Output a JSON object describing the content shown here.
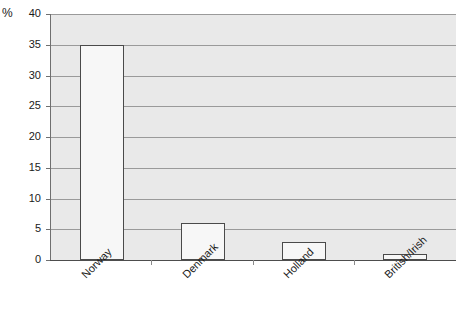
{
  "chart_data": {
    "type": "bar",
    "title": "",
    "xlabel": "",
    "ylabel": "%",
    "categories": [
      "Norway",
      "Denmark",
      "Holland",
      "British/Irish"
    ],
    "values": [
      35,
      6,
      3,
      1
    ],
    "ylim": [
      0,
      40
    ],
    "yticks": [
      0,
      5,
      10,
      15,
      20,
      25,
      30,
      35,
      40
    ],
    "ytick_labels": [
      "0",
      "5",
      "10",
      "15",
      "20",
      "25",
      "30",
      "35",
      "40"
    ],
    "grid": true,
    "legend": "none",
    "series": [
      {
        "name": "",
        "values": [
          35,
          6,
          3,
          1
        ]
      }
    ],
    "colors": {
      "bar_fill": "#f7f7f7",
      "bar_border": "#4a4a4a",
      "plot_background": "#e9e9e9",
      "gridline": "#9a9a9a",
      "axis": "#4d4d4d",
      "text": "#1a1a1a"
    }
  }
}
